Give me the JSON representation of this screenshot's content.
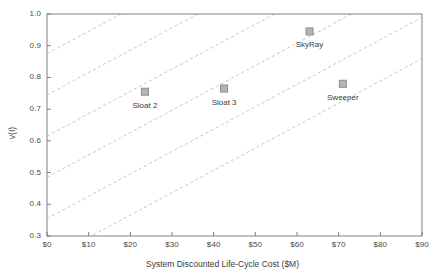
{
  "chart_data": {
    "type": "scatter",
    "title": "",
    "xlabel": "System Discounted Life-Cycle Cost ($M)",
    "ylabel": "v(I)",
    "xlim": [
      0,
      90
    ],
    "ylim": [
      0.3,
      1.0
    ],
    "xticks": [
      0,
      10,
      20,
      30,
      40,
      50,
      60,
      70,
      80,
      90
    ],
    "xtick_labels": [
      "$0",
      "$10",
      "$20",
      "$30",
      "$40",
      "$50",
      "$60",
      "$70",
      "$80",
      "$90"
    ],
    "yticks": [
      0.3,
      0.4,
      0.5,
      0.6,
      0.7,
      0.8,
      0.9,
      1.0
    ],
    "ytick_labels": [
      "0.3",
      "0.4",
      "0.5",
      "0.6",
      "0.7",
      "0.8",
      "0.9",
      "1.0"
    ],
    "grid": false,
    "legend": "none",
    "marker_shape": "square",
    "marker_color": "#b4b4b4",
    "marker_edge_color": "#8c8c8c",
    "points": [
      {
        "label": "Sloat 2",
        "x": 23.5,
        "y": 0.755,
        "label_dx": 0,
        "label_dy": 14
      },
      {
        "label": "Sloat 3",
        "x": 42.5,
        "y": 0.765,
        "label_dx": 0,
        "label_dy": 14
      },
      {
        "label": "SkyRay",
        "x": 63.0,
        "y": 0.945,
        "label_dx": 0,
        "label_dy": 14
      },
      {
        "label": "Sweeper",
        "x": 71.0,
        "y": 0.78,
        "label_dx": 0,
        "label_dy": 14
      }
    ],
    "iso_lines": {
      "style": "dashed",
      "color": "#c0c0c8",
      "slope_per_M": 0.00705,
      "intercepts": [
        0.225,
        0.355,
        0.485,
        0.615,
        0.745,
        0.875,
        1.005
      ]
    },
    "axis_color": "#808080",
    "text_color": "#3a3a3a"
  }
}
